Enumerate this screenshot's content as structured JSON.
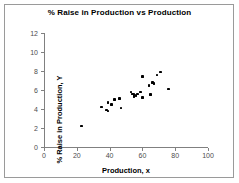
{
  "chart_data": {
    "type": "scatter",
    "title": "% Raise in Production vs Production",
    "xlabel": "Production, x",
    "ylabel": "% Raise in Production, Y",
    "xlim": [
      0,
      100
    ],
    "ylim": [
      0,
      12
    ],
    "xticks": [
      0,
      20,
      40,
      60,
      80,
      100
    ],
    "yticks": [
      0,
      2,
      4,
      6,
      8,
      10,
      12
    ],
    "grid": false,
    "legend": false,
    "marker_color": "#000000",
    "axis_color": "#808080",
    "points": [
      {
        "x": 23,
        "y": 2.2
      },
      {
        "x": 35,
        "y": 4.2
      },
      {
        "x": 38,
        "y": 3.9
      },
      {
        "x": 39,
        "y": 3.8
      },
      {
        "x": 39,
        "y": 4.7
      },
      {
        "x": 41,
        "y": 4.5
      },
      {
        "x": 43,
        "y": 5.0
      },
      {
        "x": 46,
        "y": 5.1
      },
      {
        "x": 47,
        "y": 4.1
      },
      {
        "x": 53,
        "y": 5.8
      },
      {
        "x": 54,
        "y": 5.6
      },
      {
        "x": 55,
        "y": 5.5
      },
      {
        "x": 55,
        "y": 5.3
      },
      {
        "x": 56,
        "y": 5.4
      },
      {
        "x": 57,
        "y": 5.6
      },
      {
        "x": 59,
        "y": 5.8
      },
      {
        "x": 60,
        "y": 7.4
      },
      {
        "x": 60,
        "y": 5.2
      },
      {
        "x": 64,
        "y": 6.5
      },
      {
        "x": 65,
        "y": 5.5
      },
      {
        "x": 66,
        "y": 6.8
      },
      {
        "x": 67,
        "y": 6.7
      },
      {
        "x": 69,
        "y": 7.6
      },
      {
        "x": 71,
        "y": 7.9
      },
      {
        "x": 76,
        "y": 6.1
      }
    ]
  }
}
